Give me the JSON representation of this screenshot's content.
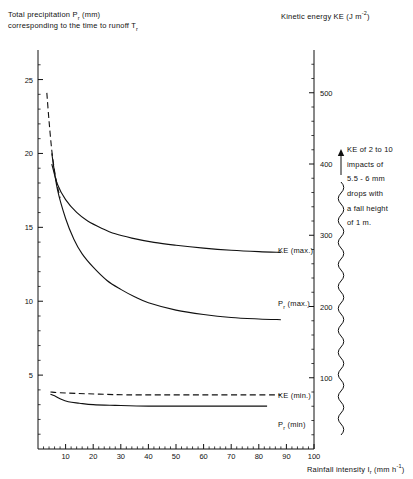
{
  "figure": {
    "left_axis_title_line1": "Total precipitation P",
    "left_axis_title_line1_sub": "r",
    "left_axis_title_line1_tail": " (mm)",
    "left_axis_title_line2": "corresponding to the time to runoff T",
    "left_axis_title_line2_sub": "r",
    "right_axis_title": "Kinetic energy KE (J m",
    "right_axis_title_sup": "-2",
    "right_axis_title_tail": ")",
    "x_axis_title": "Rainfall intensity I",
    "x_axis_title_sub": "r",
    "x_axis_title_tail": " (mm h",
    "x_axis_title_sup": "-1",
    "x_axis_title_tail2": ")",
    "annotation": [
      "KE of 2 to 10",
      "impacts of",
      "5.5 - 6 mm",
      "drops with",
      "a fall height",
      "of  1 m."
    ],
    "curve_labels": [
      {
        "text": "KE (max.)",
        "x": 278,
        "y": 251
      },
      {
        "text": "P",
        "sub": "r",
        "tail": " (max.)",
        "x": 278,
        "y": 304
      },
      {
        "text": "KE (min.)",
        "x": 278,
        "y": 396
      },
      {
        "text": "P",
        "sub": "r",
        "tail": " (min)",
        "x": 278,
        "y": 425
      }
    ]
  },
  "chart_data": {
    "type": "line",
    "title": "",
    "xlabel": "Rainfall intensity Ir (mm h-1)",
    "ylabel": "Total precipitation Pr (mm) corresponding to the time to runoff Tr",
    "y2label": "Kinetic energy KE (J m-2)",
    "xlim": [
      0,
      100
    ],
    "ylim": [
      0,
      27
    ],
    "y2lim": [
      0,
      560
    ],
    "xticks": [
      10,
      20,
      30,
      40,
      50,
      60,
      70,
      80,
      90,
      100
    ],
    "yticks": [
      5,
      10,
      15,
      20,
      25
    ],
    "y2ticks": [
      100,
      200,
      300,
      400,
      500
    ],
    "grid": false,
    "legend": "inline-curve-labels",
    "series": [
      {
        "name": "Pr (max.)",
        "axis": "left",
        "style": "solid",
        "points": [
          [
            5,
            20.0
          ],
          [
            7,
            17.6
          ],
          [
            10,
            15.6
          ],
          [
            13,
            14.2
          ],
          [
            16,
            13.2
          ],
          [
            20,
            12.3
          ],
          [
            25,
            11.4
          ],
          [
            30,
            10.8
          ],
          [
            35,
            10.3
          ],
          [
            40,
            9.9
          ],
          [
            50,
            9.4
          ],
          [
            60,
            9.1
          ],
          [
            70,
            8.9
          ],
          [
            80,
            8.8
          ],
          [
            88,
            8.75
          ]
        ]
      },
      {
        "name": "Pr (max.) dashed extension",
        "axis": "left",
        "style": "dashed",
        "points": [
          [
            3.2,
            24.1
          ],
          [
            4,
            22.2
          ],
          [
            5,
            20.2
          ],
          [
            6,
            18.8
          ],
          [
            7,
            17.8
          ],
          [
            8,
            17.0
          ]
        ]
      },
      {
        "name": "KE (max.)",
        "axis": "right",
        "style": "solid",
        "points": [
          [
            5,
            400
          ],
          [
            7,
            372
          ],
          [
            10,
            350
          ],
          [
            14,
            332
          ],
          [
            18,
            320
          ],
          [
            23,
            310
          ],
          [
            28,
            302
          ],
          [
            34,
            296
          ],
          [
            42,
            290
          ],
          [
            50,
            286
          ],
          [
            60,
            282
          ],
          [
            70,
            279
          ],
          [
            80,
            277
          ],
          [
            88,
            276
          ]
        ]
      },
      {
        "name": "Pr (min)",
        "axis": "left",
        "style": "solid",
        "points": [
          [
            4.5,
            3.7
          ],
          [
            6,
            3.6
          ],
          [
            8,
            3.4
          ],
          [
            11,
            3.2
          ],
          [
            15,
            3.1
          ],
          [
            20,
            3.0
          ],
          [
            28,
            2.95
          ],
          [
            40,
            2.9
          ],
          [
            55,
            2.9
          ],
          [
            70,
            2.9
          ],
          [
            83,
            2.9
          ]
        ]
      },
      {
        "name": "KE (min.)",
        "axis": "right",
        "style": "dashed",
        "points": [
          [
            4.5,
            80
          ],
          [
            8,
            79
          ],
          [
            14,
            78
          ],
          [
            22,
            77
          ],
          [
            32,
            76
          ],
          [
            45,
            76
          ],
          [
            60,
            76
          ],
          [
            75,
            76
          ],
          [
            88,
            76
          ]
        ]
      }
    ]
  }
}
